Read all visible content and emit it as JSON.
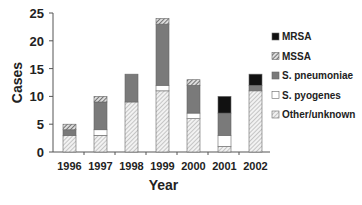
{
  "chart_data": {
    "type": "bar",
    "stacked": true,
    "title": "",
    "xlabel": "Year",
    "ylabel": "Cases",
    "ylim": [
      0,
      25
    ],
    "yticks": [
      0,
      5,
      10,
      15,
      20,
      25
    ],
    "grid": false,
    "legend_position": "right",
    "categories": [
      "1996",
      "1997",
      "1998",
      "1999",
      "2000",
      "2001",
      "2002"
    ],
    "series": [
      {
        "name": "Other/unknown",
        "pattern": "hatch-light",
        "values": [
          3,
          3,
          9,
          11,
          6,
          1,
          11
        ]
      },
      {
        "name": "S. pyogenes",
        "pattern": "white",
        "values": [
          0,
          1,
          0,
          1,
          1,
          2,
          0
        ]
      },
      {
        "name": "S. pneumoniae",
        "pattern": "gray",
        "values": [
          1,
          5,
          5,
          11,
          5,
          4,
          1
        ]
      },
      {
        "name": "MSSA",
        "pattern": "hatch-dark",
        "values": [
          1,
          1,
          0,
          1,
          1,
          0,
          0
        ]
      },
      {
        "name": "MRSA",
        "pattern": "black",
        "values": [
          0,
          0,
          0,
          0,
          0,
          3,
          2
        ]
      }
    ],
    "totals": [
      5,
      10,
      14,
      24,
      13,
      10,
      14
    ],
    "legend_order": [
      "MRSA",
      "MSSA",
      "S. pneumoniae",
      "S. pyogenes",
      "Other/unknown"
    ]
  },
  "colors": {
    "gray": "#7a7a7a",
    "black": "#111111",
    "axis": "#555555"
  }
}
